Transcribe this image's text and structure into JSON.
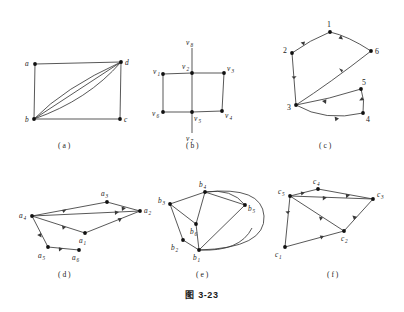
{
  "figure": {
    "caption": "图 3-23",
    "panels": [
      {
        "id": "a",
        "caption": "( a )",
        "directed": false,
        "nodes": [
          {
            "label": "a",
            "sub": ""
          },
          {
            "label": "d",
            "sub": ""
          },
          {
            "label": "b",
            "sub": ""
          },
          {
            "label": "c",
            "sub": ""
          }
        ],
        "edges": [
          "a-d",
          "a-b",
          "b-c",
          "c-d",
          "b-d",
          "b-d",
          "b-d"
        ]
      },
      {
        "id": "b",
        "caption": "( b )",
        "directed": false,
        "nodes": [
          {
            "label": "v",
            "sub": "1"
          },
          {
            "label": "v",
            "sub": "2"
          },
          {
            "label": "v",
            "sub": "3"
          },
          {
            "label": "v",
            "sub": "4"
          },
          {
            "label": "v",
            "sub": "5"
          },
          {
            "label": "v",
            "sub": "6"
          },
          {
            "label": "v",
            "sub": "7"
          },
          {
            "label": "v",
            "sub": "8"
          }
        ],
        "edges": [
          "v1-v2",
          "v2-v3",
          "v1-v6",
          "v6-v5",
          "v5-v4",
          "v3-v4",
          "v2-v5",
          "v2-v8",
          "v5-v7"
        ]
      },
      {
        "id": "c",
        "caption": "( c )",
        "directed": true,
        "nodes": [
          {
            "label": "1",
            "sub": ""
          },
          {
            "label": "2",
            "sub": ""
          },
          {
            "label": "3",
            "sub": ""
          },
          {
            "label": "4",
            "sub": ""
          },
          {
            "label": "5",
            "sub": ""
          },
          {
            "label": "6",
            "sub": ""
          }
        ],
        "edges": [
          "1->2",
          "1->6",
          "2->3",
          "3->6",
          "3->4",
          "4->5",
          "5->3"
        ]
      },
      {
        "id": "d",
        "caption": "( d )",
        "directed": true,
        "nodes": [
          {
            "label": "a",
            "sub": "1"
          },
          {
            "label": "a",
            "sub": "2"
          },
          {
            "label": "a",
            "sub": "3"
          },
          {
            "label": "a",
            "sub": "4"
          },
          {
            "label": "a",
            "sub": "5"
          },
          {
            "label": "a",
            "sub": "6"
          }
        ],
        "edges": [
          "a3->a4",
          "a3->a2",
          "a4->a2",
          "a4->a1",
          "a1->a2",
          "a4->a5",
          "a5->a6"
        ]
      },
      {
        "id": "e",
        "caption": "( e )",
        "directed": false,
        "nodes": [
          {
            "label": "b",
            "sub": "1"
          },
          {
            "label": "b",
            "sub": "2"
          },
          {
            "label": "b",
            "sub": "3"
          },
          {
            "label": "b",
            "sub": "4"
          },
          {
            "label": "b",
            "sub": "5"
          },
          {
            "label": "b",
            "sub": "6"
          }
        ],
        "edges": [
          "b3-b4",
          "b4-b5",
          "b4-b5",
          "b4-b6",
          "b3-b6",
          "b3-b2",
          "b2-b1",
          "b1-b6",
          "b1-b5",
          "b1-b5"
        ]
      },
      {
        "id": "f",
        "caption": "( f )",
        "directed": true,
        "nodes": [
          {
            "label": "c",
            "sub": "1"
          },
          {
            "label": "c",
            "sub": "2"
          },
          {
            "label": "c",
            "sub": "3"
          },
          {
            "label": "c",
            "sub": "4"
          },
          {
            "label": "c",
            "sub": "5"
          }
        ],
        "edges": [
          "c5->c4",
          "c4->c3",
          "c5->c3",
          "c5->c2",
          "c5->c1",
          "c1->c2",
          "c3->c2"
        ]
      }
    ]
  },
  "labels": {
    "a_a": "a",
    "a_b": "b",
    "a_c": "c",
    "a_d": "d",
    "b_v": "v",
    "c_1": "1",
    "c_2": "2",
    "c_3": "3",
    "c_4": "4",
    "c_5": "5",
    "c_6": "6",
    "d_a": "a",
    "e_b": "b",
    "f_c": "c",
    "s1": "1",
    "s2": "2",
    "s3": "3",
    "s4": "4",
    "s5": "5",
    "s6": "6",
    "s7": "7",
    "s8": "8"
  }
}
